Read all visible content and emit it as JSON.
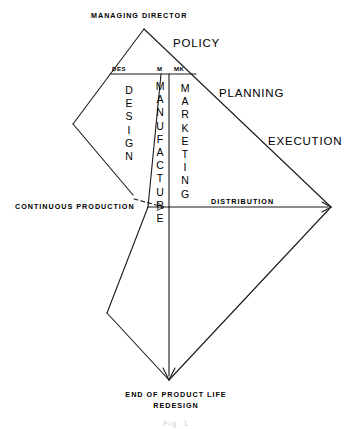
{
  "figure": {
    "caption": "Fig. 1",
    "line_color": "#1a1a1a",
    "background_color": "#ffffff"
  },
  "labels": {
    "top": "MANAGING DIRECTOR",
    "policy": "POLICY",
    "planning": "PLANNING",
    "execution": "EXECUTION",
    "distribution": "DISTRIBUTION",
    "continuous_production": "CONTINUOUS PRODUCTION",
    "bottom_line_1": "END OF PRODUCT LIFE",
    "bottom_line_2": "REDESIGN"
  },
  "column_tags": {
    "design": "DES",
    "manufacture": "M",
    "marketing": "MK"
  },
  "bands": [
    {
      "name": "design",
      "text": "DESIGN",
      "letters": [
        "D",
        "E",
        "S",
        "I",
        "G",
        "N"
      ]
    },
    {
      "name": "manufacture",
      "text": "MANUFACTURE",
      "letters": [
        "M",
        "A",
        "N",
        "U",
        "F",
        "A",
        "C",
        "T",
        "U",
        "R",
        "E"
      ]
    },
    {
      "name": "marketing",
      "text": "MARKETING",
      "letters": [
        "M",
        "A",
        "R",
        "K",
        "E",
        "T",
        "I",
        "N",
        "G"
      ]
    }
  ],
  "geometry": {
    "apex": [
      144,
      29
    ],
    "left_vertex": [
      73,
      124
    ],
    "right_vertex": [
      331,
      207
    ],
    "bottom_vertex": [
      169,
      380
    ],
    "lower_left_vertex": [
      107,
      313
    ],
    "upper_band_line_y": 74,
    "mid_line_y": 207
  }
}
